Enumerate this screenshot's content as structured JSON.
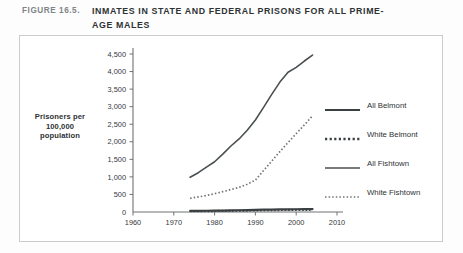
{
  "figure": {
    "number": "FIGURE 16.5.",
    "title": "INMATES IN STATE AND FEDERAL PRISONS FOR ALL PRIME-AGE MALES"
  },
  "colors": {
    "frame": "#c8cccf",
    "axis": "#6e7376",
    "text_dark": "#2d3234",
    "text_gray": "#7f8487",
    "series_all_belmont": "#3a3f42",
    "series_white_belmont": "#3a3f42",
    "series_all_fishtown": "#4a4f52",
    "series_white_fishtown": "#6f7477",
    "background": "#ffffff"
  },
  "axis_label": {
    "line1": "Prisoners per",
    "line2": "100,000",
    "line3": "population"
  },
  "legend": {
    "items": [
      {
        "label": "All Belmont",
        "style": "solid-thick",
        "color": "#3a3f42"
      },
      {
        "label": "White Belmont",
        "style": "dotted-thick",
        "color": "#3a3f42"
      },
      {
        "label": "All Fishtown",
        "style": "solid-thin",
        "color": "#4a4f52"
      },
      {
        "label": "White Fishtown",
        "style": "dotted-thin",
        "color": "#6f7477"
      }
    ]
  },
  "chart_data": {
    "type": "line",
    "title": "INMATES IN STATE AND FEDERAL PRISONS FOR ALL PRIME-AGE MALES",
    "xlabel": "",
    "ylabel": "Prisoners per 100,000 population",
    "xlim": [
      1960,
      2010
    ],
    "ylim": [
      0,
      4500
    ],
    "xticks": [
      1960,
      1970,
      1980,
      1990,
      2000,
      2010
    ],
    "yticks": [
      0,
      500,
      1000,
      1500,
      2000,
      2500,
      3000,
      3500,
      4000,
      4500
    ],
    "ytick_labels": [
      "0",
      "500",
      "1,000",
      "1,500",
      "2,000",
      "2,500",
      "3,000",
      "3,500",
      "4,000",
      "4,500"
    ],
    "xtick_labels": [
      "1960",
      "1970",
      "1980",
      "1990",
      "2000",
      "2010"
    ],
    "grid": false,
    "legend_position": "right",
    "series": [
      {
        "name": "All Belmont",
        "style": "solid-thick",
        "x": [
          1974,
          1976,
          1978,
          1980,
          1982,
          1984,
          1986,
          1988,
          1990,
          1992,
          1994,
          1996,
          1998,
          2000,
          2002,
          2004
        ],
        "values": [
          30,
          32,
          35,
          38,
          42,
          45,
          50,
          55,
          60,
          65,
          68,
          72,
          75,
          78,
          80,
          82
        ]
      },
      {
        "name": "White Belmont",
        "style": "dotted-thick",
        "x": [
          1974,
          1976,
          1978,
          1980,
          1982,
          1984,
          1986,
          1988,
          1990,
          1992,
          1994,
          1996,
          1998,
          2000,
          2002,
          2004
        ],
        "values": [
          22,
          24,
          26,
          28,
          31,
          34,
          38,
          42,
          46,
          50,
          53,
          56,
          58,
          60,
          62,
          64
        ]
      },
      {
        "name": "All Fishtown",
        "style": "solid-thin",
        "x": [
          1974,
          1976,
          1978,
          1980,
          1982,
          1984,
          1986,
          1988,
          1990,
          1992,
          1994,
          1996,
          1998,
          2000,
          2002,
          2004
        ],
        "values": [
          990,
          1120,
          1280,
          1430,
          1650,
          1880,
          2080,
          2330,
          2620,
          2980,
          3350,
          3700,
          3980,
          4120,
          4300,
          4470
        ]
      },
      {
        "name": "White Fishtown",
        "style": "dotted-thin",
        "x": [
          1974,
          1976,
          1978,
          1980,
          1982,
          1984,
          1986,
          1988,
          1990,
          1992,
          1994,
          1996,
          1998,
          2000,
          2002,
          2004
        ],
        "values": [
          390,
          430,
          470,
          520,
          580,
          640,
          700,
          790,
          910,
          1180,
          1450,
          1720,
          1980,
          2230,
          2480,
          2740
        ]
      }
    ]
  }
}
